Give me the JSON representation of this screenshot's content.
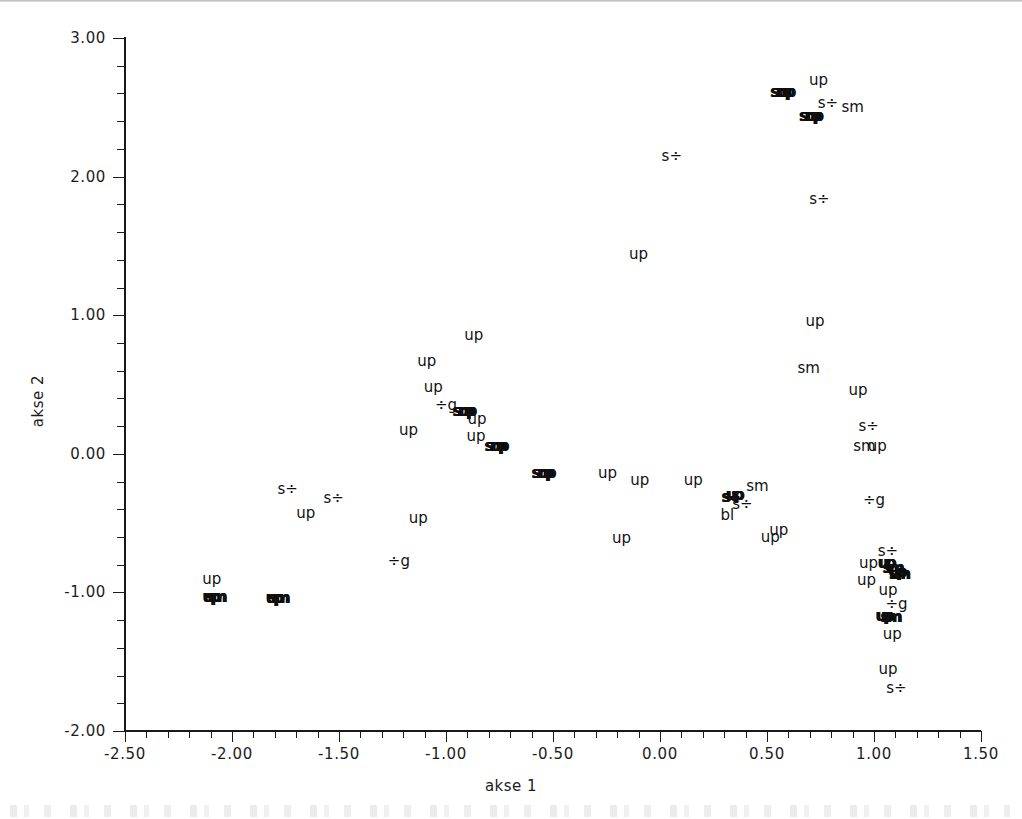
{
  "chart_data": {
    "type": "scatter",
    "title": "",
    "xlabel": "akse 1",
    "ylabel": "akse 2",
    "xlim": [
      -2.5,
      1.5
    ],
    "ylim": [
      -2.0,
      3.0
    ],
    "xticks": [
      -2.5,
      -2.0,
      -1.5,
      -1.0,
      -0.5,
      0.0,
      0.5,
      1.0,
      1.5
    ],
    "xtick_labels": [
      "-2.50",
      "-2.00",
      "-1.50",
      "-1.00",
      "-0.50",
      "0.00",
      "0.50",
      "1.00",
      "1.50"
    ],
    "yticks": [
      -2.0,
      -1.0,
      0.0,
      1.0,
      2.0,
      3.0
    ],
    "ytick_labels": [
      "-2.00",
      "-1.00",
      "0.00",
      "1.00",
      "2.00",
      "3.00"
    ],
    "x_minor_tick_step": 0.1,
    "y_minor_tick_step": 0.2,
    "grid": false,
    "legend": false,
    "marker_style": "text-label",
    "categories": [
      "up",
      "sm",
      "s÷",
      "÷g",
      "bl"
    ],
    "points": [
      {
        "label": "sm",
        "x": 0.56,
        "y": 2.61,
        "overlap": true
      },
      {
        "label": "up",
        "x": 0.585,
        "y": 2.61,
        "overlap": true
      },
      {
        "label": "up",
        "x": 0.74,
        "y": 2.7,
        "overlap": false
      },
      {
        "label": "s÷",
        "x": 0.785,
        "y": 2.53,
        "overlap": false
      },
      {
        "label": "sm",
        "x": 0.9,
        "y": 2.5,
        "overlap": false
      },
      {
        "label": "sm",
        "x": 0.695,
        "y": 2.44,
        "overlap": true
      },
      {
        "label": "up",
        "x": 0.715,
        "y": 2.44,
        "overlap": true
      },
      {
        "label": "s÷",
        "x": 0.055,
        "y": 2.15,
        "overlap": false
      },
      {
        "label": "s÷",
        "x": 0.745,
        "y": 1.84,
        "overlap": false
      },
      {
        "label": "up",
        "x": -0.1,
        "y": 1.44,
        "overlap": false
      },
      {
        "label": "up",
        "x": 0.725,
        "y": 0.96,
        "overlap": false
      },
      {
        "label": "up",
        "x": -0.87,
        "y": 0.86,
        "overlap": false
      },
      {
        "label": "up",
        "x": -1.09,
        "y": 0.67,
        "overlap": false
      },
      {
        "label": "sm",
        "x": 0.695,
        "y": 0.62,
        "overlap": false
      },
      {
        "label": "up",
        "x": -1.06,
        "y": 0.48,
        "overlap": false
      },
      {
        "label": "up",
        "x": 0.925,
        "y": 0.46,
        "overlap": false
      },
      {
        "label": "÷g",
        "x": -1.0,
        "y": 0.35,
        "overlap": false
      },
      {
        "label": "sm",
        "x": -0.925,
        "y": 0.31,
        "overlap": true
      },
      {
        "label": "up",
        "x": -0.905,
        "y": 0.31,
        "overlap": true
      },
      {
        "label": "up",
        "x": -0.855,
        "y": 0.25,
        "overlap": false
      },
      {
        "label": "s÷",
        "x": 0.975,
        "y": 0.2,
        "overlap": false
      },
      {
        "label": "up",
        "x": -1.175,
        "y": 0.17,
        "overlap": false
      },
      {
        "label": "up",
        "x": -0.86,
        "y": 0.13,
        "overlap": false
      },
      {
        "label": "sm",
        "x": 0.955,
        "y": 0.06,
        "overlap": false
      },
      {
        "label": "up",
        "x": 1.015,
        "y": 0.06,
        "overlap": false
      },
      {
        "label": "sm",
        "x": -0.775,
        "y": 0.06,
        "overlap": true
      },
      {
        "label": "up",
        "x": -0.755,
        "y": 0.06,
        "overlap": true
      },
      {
        "label": "sm",
        "x": -0.555,
        "y": -0.14,
        "overlap": true
      },
      {
        "label": "up",
        "x": -0.535,
        "y": -0.14,
        "overlap": true
      },
      {
        "label": "up",
        "x": -0.245,
        "y": -0.14,
        "overlap": false
      },
      {
        "label": "up",
        "x": -0.095,
        "y": -0.19,
        "overlap": false
      },
      {
        "label": "up",
        "x": 0.155,
        "y": -0.19,
        "overlap": false
      },
      {
        "label": "sm",
        "x": 0.455,
        "y": -0.23,
        "overlap": false
      },
      {
        "label": "s÷",
        "x": -1.74,
        "y": -0.25,
        "overlap": false
      },
      {
        "label": "s÷",
        "x": 0.325,
        "y": -0.31,
        "overlap": true
      },
      {
        "label": "up",
        "x": 0.345,
        "y": -0.3,
        "overlap": true
      },
      {
        "label": "s÷",
        "x": -1.525,
        "y": -0.32,
        "overlap": false
      },
      {
        "label": "÷g",
        "x": 1.0,
        "y": -0.33,
        "overlap": false
      },
      {
        "label": "s÷",
        "x": 0.385,
        "y": -0.36,
        "overlap": false
      },
      {
        "label": "up",
        "x": -1.655,
        "y": -0.43,
        "overlap": false
      },
      {
        "label": "bl",
        "x": 0.315,
        "y": -0.44,
        "overlap": false
      },
      {
        "label": "up",
        "x": -1.13,
        "y": -0.46,
        "overlap": false
      },
      {
        "label": "up",
        "x": 0.555,
        "y": -0.55,
        "overlap": false
      },
      {
        "label": "up",
        "x": 0.515,
        "y": -0.6,
        "overlap": false
      },
      {
        "label": "up",
        "x": -0.18,
        "y": -0.61,
        "overlap": false
      },
      {
        "label": "s÷",
        "x": 1.065,
        "y": -0.7,
        "overlap": false
      },
      {
        "label": "up",
        "x": 1.055,
        "y": -0.79,
        "overlap": true
      },
      {
        "label": "sm",
        "x": 1.085,
        "y": -0.82,
        "overlap": true
      },
      {
        "label": "÷g",
        "x": -1.22,
        "y": -0.77,
        "overlap": false
      },
      {
        "label": "up",
        "x": 0.975,
        "y": -0.79,
        "overlap": false
      },
      {
        "label": "up",
        "x": 1.105,
        "y": -0.85,
        "overlap": true
      },
      {
        "label": "sm",
        "x": 1.115,
        "y": -0.87,
        "overlap": true
      },
      {
        "label": "up",
        "x": -2.095,
        "y": -0.9,
        "overlap": false
      },
      {
        "label": "up",
        "x": 0.965,
        "y": -0.91,
        "overlap": false
      },
      {
        "label": "up",
        "x": 1.065,
        "y": -0.98,
        "overlap": false
      },
      {
        "label": "up",
        "x": -2.1,
        "y": -1.03,
        "overlap": true
      },
      {
        "label": "sm",
        "x": -2.08,
        "y": -1.03,
        "overlap": true
      },
      {
        "label": "up",
        "x": -1.805,
        "y": -1.04,
        "overlap": true
      },
      {
        "label": "sm",
        "x": -1.785,
        "y": -1.04,
        "overlap": true
      },
      {
        "label": "÷g",
        "x": 1.105,
        "y": -1.08,
        "overlap": false
      },
      {
        "label": "up",
        "x": 1.045,
        "y": -1.17,
        "overlap": true
      },
      {
        "label": "sm",
        "x": 1.075,
        "y": -1.18,
        "overlap": true
      },
      {
        "label": "up",
        "x": 1.085,
        "y": -1.3,
        "overlap": false
      },
      {
        "label": "up",
        "x": 1.065,
        "y": -1.55,
        "overlap": false
      },
      {
        "label": "s÷",
        "x": 1.105,
        "y": -1.69,
        "overlap": false
      }
    ]
  },
  "axes": {
    "x_title": "akse 1",
    "y_title": "akse 2"
  }
}
